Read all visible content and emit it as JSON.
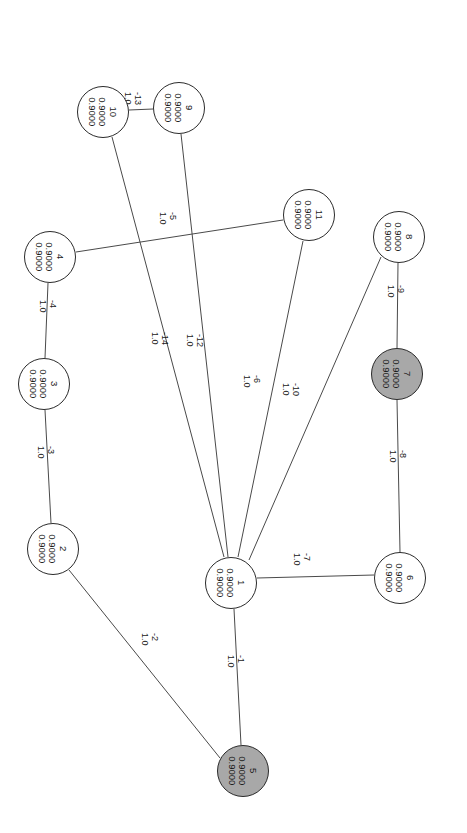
{
  "diagram": {
    "text_orientation_degrees": 90,
    "canvas": {
      "width": 467,
      "height": 833
    },
    "colors": {
      "background": "#ffffff",
      "node_fill_plain": "#ffffff",
      "node_fill_shaded": "#a8a8a8",
      "node_stroke": "#2b2b2b",
      "edge_stroke": "#4a4a4a",
      "text": "#1a1a1a"
    },
    "node_value_label": "0.9000",
    "edge_weight_label": "1.0",
    "nodes": [
      {
        "id": "10",
        "value": "0.9000",
        "value2": "0.9000",
        "shaded": false,
        "cx": 103,
        "cy": 112,
        "r": 26
      },
      {
        "id": "9",
        "value": "0.9000",
        "value2": "0.9000",
        "shaded": false,
        "cx": 179,
        "cy": 108,
        "r": 26
      },
      {
        "id": "11",
        "value": "0.9000",
        "value2": "0.9000",
        "shaded": false,
        "cx": 309,
        "cy": 215,
        "r": 26
      },
      {
        "id": "8",
        "value": "0.9000",
        "value2": "0.9000",
        "shaded": false,
        "cx": 399,
        "cy": 237,
        "r": 26
      },
      {
        "id": "4",
        "value": "0.9000",
        "value2": "0.9000",
        "shaded": false,
        "cx": 50,
        "cy": 257,
        "r": 26
      },
      {
        "id": "7",
        "value": "0.9000",
        "value2": "0.9000",
        "shaded": true,
        "cx": 397,
        "cy": 374,
        "r": 26
      },
      {
        "id": "3",
        "value": "0.9000",
        "value2": "0.9000",
        "shaded": false,
        "cx": 44,
        "cy": 384,
        "r": 26
      },
      {
        "id": "2",
        "value": "0.9000",
        "value2": "0.9000",
        "shaded": false,
        "cx": 53,
        "cy": 549,
        "r": 26
      },
      {
        "id": "6",
        "value": "0.9000",
        "value2": "0.9000",
        "shaded": false,
        "cx": 400,
        "cy": 578,
        "r": 26
      },
      {
        "id": "1",
        "value": "0.9000",
        "value2": "0.9000",
        "shaded": false,
        "cx": 231,
        "cy": 583,
        "r": 26
      },
      {
        "id": "5",
        "value": "0.9000",
        "value2": "0.9000",
        "shaded": true,
        "cx": 243,
        "cy": 771,
        "r": 26
      }
    ],
    "edges": [
      {
        "id": "-13",
        "weight": "1.0",
        "source": "10",
        "target": "9",
        "x1": 129,
        "y1": 110,
        "x2": 153,
        "y2": 109,
        "lx": 143,
        "ly": 92
      },
      {
        "id": "-14",
        "weight": "1.0",
        "source": "10",
        "target": "1",
        "x1": 112,
        "y1": 137,
        "x2": 224,
        "y2": 557,
        "lx": 170,
        "ly": 332
      },
      {
        "id": "-12",
        "weight": "1.0",
        "source": "9",
        "target": "1",
        "x1": 181,
        "y1": 134,
        "x2": 228,
        "y2": 557,
        "lx": 205,
        "ly": 334
      },
      {
        "id": "-5",
        "weight": "1.0",
        "source": "4",
        "target": "11",
        "x1": 76,
        "y1": 252,
        "x2": 283,
        "y2": 220,
        "lx": 178,
        "ly": 212
      },
      {
        "id": "-4",
        "weight": "1.0",
        "source": "4",
        "target": "3",
        "x1": 48,
        "y1": 283,
        "x2": 45,
        "y2": 358,
        "lx": 58,
        "ly": 300
      },
      {
        "id": "-3",
        "weight": "1.0",
        "source": "3",
        "target": "2",
        "x1": 45,
        "y1": 410,
        "x2": 51,
        "y2": 523,
        "lx": 56,
        "ly": 446
      },
      {
        "id": "-6",
        "weight": "1.0",
        "source": "11",
        "target": "1",
        "x1": 303,
        "y1": 241,
        "x2": 238,
        "y2": 557,
        "lx": 262,
        "ly": 375
      },
      {
        "id": "-10",
        "weight": "1.0",
        "source": "8",
        "target": "1",
        "x1": 381,
        "y1": 257,
        "x2": 249,
        "y2": 560,
        "lx": 301,
        "ly": 383
      },
      {
        "id": "-9",
        "weight": "1.0",
        "source": "8",
        "target": "7",
        "x1": 398,
        "y1": 263,
        "x2": 397,
        "y2": 348,
        "lx": 406,
        "ly": 285
      },
      {
        "id": "-8",
        "weight": "1.0",
        "source": "7",
        "target": "6",
        "x1": 397,
        "y1": 400,
        "x2": 400,
        "y2": 552,
        "lx": 408,
        "ly": 450
      },
      {
        "id": "-7",
        "weight": "1.0",
        "source": "1",
        "target": "6",
        "x1": 257,
        "y1": 578,
        "x2": 374,
        "y2": 575,
        "lx": 312,
        "ly": 553
      },
      {
        "id": "-1",
        "weight": "1.0",
        "source": "1",
        "target": "5",
        "x1": 234,
        "y1": 609,
        "x2": 241,
        "y2": 745,
        "lx": 246,
        "ly": 655
      },
      {
        "id": "-2",
        "weight": "1.0",
        "source": "2",
        "target": "5",
        "x1": 69,
        "y1": 570,
        "x2": 220,
        "y2": 758,
        "lx": 160,
        "ly": 633
      }
    ]
  }
}
